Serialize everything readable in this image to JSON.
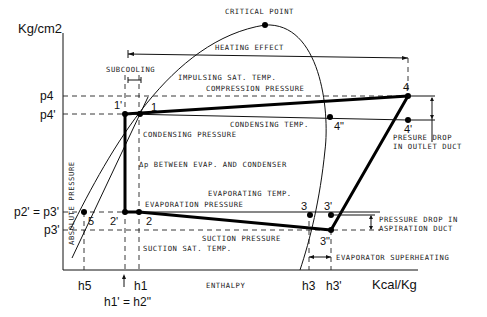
{
  "diagram": {
    "type": "pressure-enthalpy refrigeration cycle",
    "axes": {
      "y_unit": "Kg/cm2",
      "y_label": "ABSOLUTE PRESSURE",
      "x_unit": "Kcal/Kg",
      "x_label": "ENTHALPY"
    },
    "pressure_ticks": {
      "p4": "p4",
      "p4p": "p4'",
      "p2p_eq_p3": "p2' = p3'",
      "p3p": "p3'"
    },
    "enthalpy_ticks": {
      "h5": "h5",
      "h1p_eq_h2pp": "h1' = h2\"",
      "h1": "h1",
      "h3": "h3",
      "h3p": "h3'"
    },
    "points": {
      "critical_point": "CRITICAL POINT",
      "p1p": "1'",
      "p1": "1",
      "p2p": "2'",
      "p2": "2",
      "p3": "3",
      "p3p": "3'",
      "p3pp": "3\"",
      "p4": "4",
      "p4p": "4'",
      "p4pp": "4\"",
      "p5": "5"
    },
    "labels": {
      "heating_effect": "HEATING EFFECT",
      "subcooling": "SUBCOOLING",
      "impulsing_sat_temp": "IMPULSING SAT. TEMP.",
      "compression_pressure": "COMPRESSION PRESSURE",
      "condensing_temp": "CONDENSING TEMP.",
      "condensing_pressure": "CONDENSING PRESSURE",
      "delta_p": "Δp BETWEEN EVAP. AND CONDENSER",
      "evaporating_temp": "EVAPORATING TEMP.",
      "evaporation_pressure": "EVAPORATION PRESSURE",
      "suction_pressure": "SUCTION PRESSURE",
      "suction_sat_temp": "SUCTION SAT. TEMP.",
      "pressure_drop_outlet_1": "PRESURE DROP",
      "pressure_drop_outlet_2": "IN OUTLET DUCT",
      "pressure_drop_aspiration_1": "PRESSURE DROP IN",
      "pressure_drop_aspiration_2": "ASPIRATION DUCT",
      "evaporator_superheating": "EVAPORATOR SUPERHEATING"
    }
  }
}
